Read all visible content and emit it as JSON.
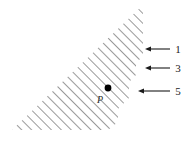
{
  "figure": {
    "type": "geometric-diagram",
    "background_color": "#ffffff",
    "hatch": {
      "color": "#6e6e6e",
      "angle_degrees": 45,
      "spacing_px": 7,
      "line_width_px": 1.4
    },
    "region": {
      "name": "hatched-triangle",
      "apex_top_right": [
        143,
        5
      ],
      "corner_bottom_left": [
        12,
        130
      ],
      "corner_bottom_right": [
        143,
        130
      ],
      "right_edge_x": 143,
      "bottom_edge_y": 130,
      "hypotenuse_from": [
        12,
        130
      ],
      "hypotenuse_to": [
        143,
        5
      ]
    },
    "step_boundary": {
      "name": "stair-step-lower-right-edge",
      "description": "Hatch strokes in the lower-right progressively terminate early, producing a layered staircase edge",
      "steps": [
        {
          "x": 143,
          "y": 56
        },
        {
          "x": 136,
          "y": 63
        },
        {
          "x": 136,
          "y": 75
        },
        {
          "x": 129,
          "y": 82
        },
        {
          "x": 129,
          "y": 98
        },
        {
          "x": 118,
          "y": 109
        },
        {
          "x": 118,
          "y": 122
        },
        {
          "x": 108,
          "y": 130
        }
      ]
    },
    "point": {
      "name": "P",
      "label": "P",
      "dot_center": [
        108,
        88
      ],
      "dot_radius_px": 3.4,
      "dot_color": "#000000",
      "label_position": [
        100,
        103
      ]
    },
    "arrows": [
      {
        "label": "1",
        "y": 49,
        "tip_x": 145,
        "tail_x": 170,
        "label_x": 178,
        "color": "#1a1a1a"
      },
      {
        "label": "3",
        "y": 68,
        "tip_x": 145,
        "tail_x": 170,
        "label_x": 178,
        "color": "#1a1a1a"
      },
      {
        "label": "5",
        "y": 91,
        "tip_x": 138,
        "tail_x": 170,
        "label_x": 178,
        "color": "#1a1a1a"
      }
    ]
  }
}
